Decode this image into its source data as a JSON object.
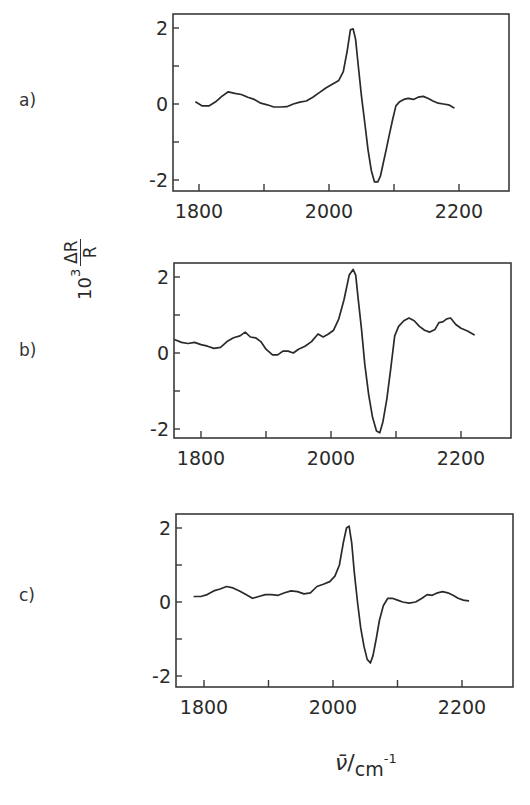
{
  "figure": {
    "y_axis_label": {
      "power": "10",
      "exponent": "3",
      "numerator": "ΔR",
      "denominator": "R"
    },
    "x_axis_label": {
      "symbol": "ν̄",
      "unit": "cm",
      "unit_exponent": "-1"
    },
    "line_color": "#2a2a2a",
    "frame_color": "#3a3a3a"
  },
  "chart_data": [
    {
      "type": "line",
      "panel": "a)",
      "title": "",
      "xlabel": "ν̄ / cm⁻¹",
      "ylabel": "10³ ΔR/R",
      "xlim": [
        1760,
        2275
      ],
      "ylim": [
        -2.3,
        2.4
      ],
      "x_ticks": [
        1800,
        1900,
        2000,
        2100,
        2200
      ],
      "x_tick_labels": [
        "1800",
        "2000",
        "2200"
      ],
      "y_ticks": [
        -2,
        -1,
        0,
        1,
        2
      ],
      "y_tick_labels": [
        "-2",
        "0",
        "2"
      ],
      "grid": false,
      "series": [
        {
          "name": "a",
          "x": [
            1795,
            1805,
            1815,
            1825,
            1835,
            1845,
            1855,
            1865,
            1875,
            1885,
            1895,
            1905,
            1915,
            1925,
            1935,
            1945,
            1955,
            1965,
            1975,
            1985,
            1995,
            2005,
            2015,
            2022,
            2028,
            2033,
            2037,
            2041,
            2045,
            2050,
            2055,
            2060,
            2065,
            2070,
            2075,
            2079,
            2083,
            2088,
            2093,
            2098,
            2103,
            2108,
            2115,
            2122,
            2130,
            2137,
            2145,
            2152,
            2160,
            2168,
            2176,
            2184,
            2192
          ],
          "y": [
            0.05,
            -0.05,
            -0.05,
            0.05,
            0.2,
            0.32,
            0.28,
            0.25,
            0.18,
            0.12,
            0.02,
            -0.02,
            -0.08,
            -0.08,
            -0.07,
            0.0,
            0.05,
            0.08,
            0.18,
            0.3,
            0.42,
            0.52,
            0.62,
            0.85,
            1.4,
            1.95,
            1.98,
            1.7,
            1.0,
            0.2,
            -0.5,
            -1.2,
            -1.75,
            -2.05,
            -2.05,
            -1.9,
            -1.6,
            -1.2,
            -0.8,
            -0.4,
            -0.05,
            0.05,
            0.12,
            0.15,
            0.12,
            0.18,
            0.2,
            0.15,
            0.08,
            0.02,
            0.0,
            -0.02,
            -0.1
          ]
        }
      ]
    },
    {
      "type": "line",
      "panel": "b)",
      "title": "",
      "xlabel": "ν̄ / cm⁻¹",
      "ylabel": "10³ ΔR/R",
      "xlim": [
        1760,
        2275
      ],
      "ylim": [
        -2.3,
        2.4
      ],
      "x_ticks": [
        1800,
        1900,
        2000,
        2100,
        2200
      ],
      "x_tick_labels": [
        "1800",
        "2000",
        "2200"
      ],
      "y_ticks": [
        -2,
        -1,
        0,
        1,
        2
      ],
      "y_tick_labels": [
        "-2",
        "0",
        "2"
      ],
      "grid": false,
      "series": [
        {
          "name": "b",
          "x": [
            1760,
            1770,
            1780,
            1790,
            1800,
            1810,
            1820,
            1830,
            1840,
            1850,
            1860,
            1868,
            1876,
            1884,
            1892,
            1900,
            1910,
            1918,
            1926,
            1934,
            1942,
            1950,
            1960,
            1970,
            1980,
            1988,
            1996,
            2004,
            2012,
            2020,
            2028,
            2034,
            2038,
            2042,
            2047,
            2052,
            2058,
            2064,
            2070,
            2075,
            2080,
            2086,
            2092,
            2098,
            2104,
            2112,
            2120,
            2128,
            2136,
            2144,
            2152,
            2160,
            2166,
            2172,
            2178,
            2184,
            2192,
            2200,
            2210,
            2220
          ],
          "y": [
            0.35,
            0.28,
            0.25,
            0.28,
            0.22,
            0.18,
            0.12,
            0.15,
            0.3,
            0.4,
            0.45,
            0.55,
            0.42,
            0.4,
            0.3,
            0.1,
            -0.05,
            -0.05,
            0.05,
            0.05,
            0.0,
            0.1,
            0.18,
            0.3,
            0.5,
            0.42,
            0.5,
            0.6,
            0.9,
            1.4,
            2.05,
            2.2,
            2.05,
            1.4,
            0.6,
            -0.3,
            -1.1,
            -1.7,
            -2.05,
            -2.1,
            -1.8,
            -1.2,
            -0.4,
            0.45,
            0.7,
            0.85,
            0.92,
            0.85,
            0.7,
            0.6,
            0.55,
            0.62,
            0.8,
            0.82,
            0.9,
            0.92,
            0.75,
            0.65,
            0.58,
            0.48
          ]
        }
      ]
    },
    {
      "type": "line",
      "panel": "c)",
      "title": "",
      "xlabel": "ν̄ / cm⁻¹",
      "ylabel": "10³ ΔR/R",
      "xlim": [
        1760,
        2275
      ],
      "ylim": [
        -2.3,
        2.4
      ],
      "x_ticks": [
        1800,
        1900,
        2000,
        2100,
        2200
      ],
      "x_tick_labels": [
        "1800",
        "2000",
        "2200"
      ],
      "y_ticks": [
        -2,
        -1,
        0,
        1,
        2
      ],
      "y_tick_labels": [
        "-2",
        "0",
        "2"
      ],
      "grid": false,
      "series": [
        {
          "name": "c",
          "x": [
            1785,
            1795,
            1805,
            1815,
            1825,
            1835,
            1845,
            1855,
            1865,
            1875,
            1885,
            1895,
            1905,
            1915,
            1925,
            1935,
            1945,
            1955,
            1965,
            1975,
            1985,
            1995,
            2003,
            2010,
            2016,
            2021,
            2025,
            2029,
            2033,
            2038,
            2043,
            2048,
            2053,
            2058,
            2062,
            2067,
            2072,
            2078,
            2085,
            2092,
            2100,
            2108,
            2118,
            2128,
            2138,
            2146,
            2154,
            2162,
            2170,
            2178,
            2186,
            2194,
            2202,
            2210
          ],
          "y": [
            0.15,
            0.15,
            0.2,
            0.3,
            0.35,
            0.42,
            0.38,
            0.3,
            0.2,
            0.1,
            0.15,
            0.2,
            0.2,
            0.18,
            0.25,
            0.3,
            0.28,
            0.22,
            0.25,
            0.42,
            0.48,
            0.55,
            0.7,
            1.0,
            1.6,
            2.0,
            2.05,
            1.6,
            0.8,
            0.0,
            -0.7,
            -1.2,
            -1.55,
            -1.65,
            -1.45,
            -1.0,
            -0.5,
            -0.1,
            0.1,
            0.1,
            0.05,
            0.0,
            -0.03,
            0.0,
            0.1,
            0.2,
            0.18,
            0.25,
            0.28,
            0.25,
            0.18,
            0.1,
            0.05,
            0.03
          ]
        }
      ]
    }
  ]
}
